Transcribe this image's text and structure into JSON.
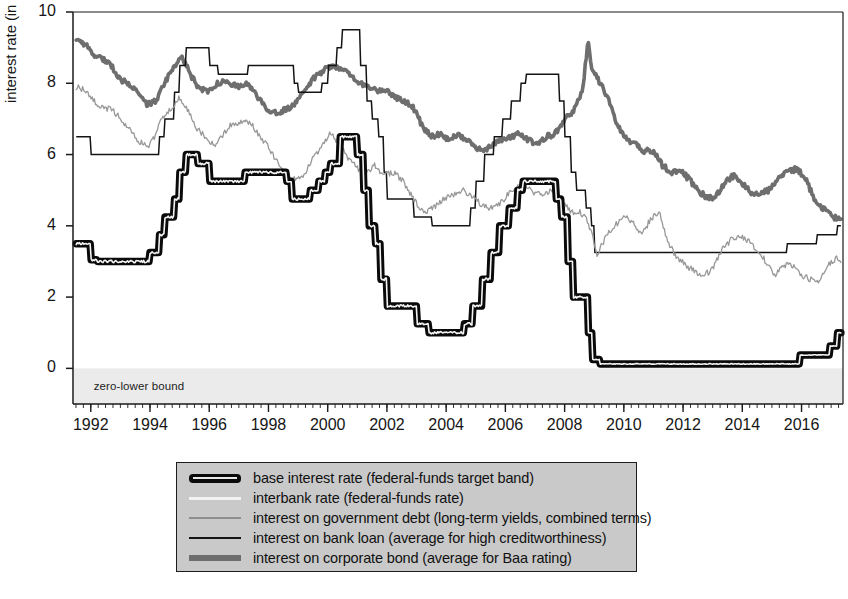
{
  "figure": {
    "background": "#ffffff",
    "plot_area": {
      "left": 73,
      "top": 12,
      "right": 843,
      "bottom": 404
    },
    "zlb_note": "zero-lower bound",
    "zlb_band_color": "#ebebeb"
  },
  "chart_data": {
    "type": "line",
    "title": "",
    "xlabel": "",
    "ylabel": "interest rate (in per cent)",
    "xlim": [
      1991.4,
      2017.4
    ],
    "ylim": [
      -1.0,
      10.0
    ],
    "ytick_values": [
      0,
      2,
      4,
      6,
      8,
      10
    ],
    "ytick_labels": [
      "0",
      "2",
      "4",
      "6",
      "8",
      "10"
    ],
    "xtick_values": [
      1992,
      1994,
      1996,
      1998,
      2000,
      2002,
      2004,
      2006,
      2008,
      2010,
      2012,
      2014,
      2016
    ],
    "xtick_labels": [
      "1992",
      "1994",
      "1996",
      "1998",
      "2000",
      "2002",
      "2004",
      "2006",
      "2008",
      "2010",
      "2012",
      "2014",
      "2016"
    ],
    "minor_xtick_step": 0.25,
    "grid": false,
    "legend_position": "below-center",
    "annotations": [
      {
        "text": "zero-lower bound",
        "x": 1992.1,
        "y": -0.55
      }
    ],
    "series": [
      {
        "name": "base interest rate (federal-funds target band)",
        "legend": "base interest rate (federal-funds target band)",
        "color": "#0a0a0a",
        "style": "band",
        "width": 7.5,
        "x": [
          1991.5,
          1991.9,
          1992.0,
          1992.2,
          1992.5,
          1993.0,
          1993.5,
          1993.9,
          1994.0,
          1994.3,
          1994.5,
          1994.8,
          1995.0,
          1995.2,
          1995.4,
          1995.6,
          1996.0,
          1996.3,
          1996.8,
          1997.2,
          1997.5,
          1998.0,
          1998.6,
          1998.8,
          1999.0,
          1999.4,
          1999.7,
          1999.9,
          2000.1,
          2000.4,
          2000.9,
          2001.0,
          2001.2,
          2001.4,
          2001.6,
          2001.8,
          2002.0,
          2002.5,
          2003.0,
          2003.4,
          2003.8,
          2004.3,
          2004.6,
          2004.9,
          2005.2,
          2005.5,
          2005.8,
          2006.1,
          2006.4,
          2006.6,
          2007.0,
          2007.5,
          2007.7,
          2007.9,
          2008.1,
          2008.3,
          2008.6,
          2008.8,
          2008.95,
          2009.2,
          2010.0,
          2011.0,
          2012.0,
          2013.0,
          2014.0,
          2015.0,
          2015.5,
          2015.95,
          2016.2,
          2016.6,
          2016.95,
          2017.2,
          2017.35
        ],
        "y": [
          3.5,
          3.5,
          3.05,
          3.0,
          3.0,
          3.0,
          3.0,
          3.0,
          3.25,
          3.75,
          4.25,
          4.75,
          5.5,
          6.0,
          6.0,
          5.75,
          5.25,
          5.25,
          5.25,
          5.5,
          5.5,
          5.5,
          5.25,
          4.75,
          4.75,
          5.0,
          5.25,
          5.5,
          5.75,
          6.5,
          6.5,
          6.0,
          5.0,
          4.0,
          3.5,
          2.5,
          1.75,
          1.75,
          1.25,
          1.0,
          1.0,
          1.0,
          1.25,
          1.75,
          2.5,
          3.25,
          4.0,
          4.5,
          5.0,
          5.25,
          5.25,
          5.25,
          4.75,
          4.25,
          3.0,
          2.0,
          2.0,
          1.0,
          0.25,
          0.125,
          0.125,
          0.125,
          0.125,
          0.125,
          0.125,
          0.125,
          0.125,
          0.375,
          0.375,
          0.375,
          0.625,
          1.0,
          1.2
        ]
      },
      {
        "name": "interbank rate (federal-funds rate)",
        "legend": "interbank rate (federal-funds rate)",
        "color": "#f4f4f4",
        "style": "thin-light",
        "width": 1.6,
        "note": "effective fed funds rate tracking the target band very closely"
      },
      {
        "name": "interest on government debt (long-term yields, combined terms)",
        "legend": "interest on government debt (long-term yields, combined terms)",
        "color": "#989898",
        "style": "thin",
        "width": 1.3,
        "x": [
          1991.5,
          1991.8,
          1992.1,
          1992.4,
          1992.7,
          1993.0,
          1993.3,
          1993.6,
          1993.9,
          1994.1,
          1994.4,
          1994.7,
          1995.0,
          1995.3,
          1995.6,
          1995.9,
          1996.2,
          1996.5,
          1996.8,
          1997.1,
          1997.4,
          1997.7,
          1998.0,
          1998.3,
          1998.6,
          1998.9,
          1999.2,
          1999.5,
          1999.8,
          2000.1,
          2000.4,
          2000.7,
          2001.0,
          2001.3,
          2001.6,
          2001.9,
          2002.2,
          2002.5,
          2002.8,
          2003.1,
          2003.4,
          2003.7,
          2004.0,
          2004.3,
          2004.6,
          2004.9,
          2005.2,
          2005.5,
          2005.8,
          2006.1,
          2006.4,
          2006.7,
          2007.0,
          2007.3,
          2007.6,
          2007.9,
          2008.2,
          2008.5,
          2008.8,
          2009.1,
          2009.4,
          2009.7,
          2010.0,
          2010.3,
          2010.6,
          2010.9,
          2011.2,
          2011.5,
          2011.8,
          2012.1,
          2012.4,
          2012.7,
          2013.0,
          2013.3,
          2013.6,
          2013.9,
          2014.2,
          2014.5,
          2014.8,
          2015.1,
          2015.4,
          2015.7,
          2016.0,
          2016.3,
          2016.6,
          2016.9,
          2017.2,
          2017.35
        ],
        "y": [
          7.9,
          7.8,
          7.5,
          7.3,
          7.3,
          7.0,
          6.7,
          6.4,
          6.2,
          6.4,
          7.0,
          7.3,
          7.6,
          7.2,
          6.7,
          6.5,
          6.2,
          6.6,
          6.9,
          6.9,
          6.9,
          6.5,
          6.2,
          5.8,
          5.5,
          5.3,
          5.4,
          5.9,
          6.2,
          6.6,
          6.3,
          5.9,
          5.6,
          5.5,
          5.7,
          5.4,
          5.5,
          5.3,
          4.9,
          4.5,
          4.4,
          4.6,
          4.8,
          4.9,
          5.0,
          4.8,
          4.6,
          4.5,
          4.6,
          4.9,
          5.1,
          5.1,
          4.9,
          4.9,
          5.0,
          4.7,
          4.4,
          4.4,
          4.1,
          3.2,
          3.7,
          4.0,
          4.3,
          4.1,
          3.7,
          4.2,
          4.4,
          3.5,
          3.1,
          2.9,
          2.7,
          2.6,
          2.8,
          3.3,
          3.6,
          3.7,
          3.6,
          3.3,
          3.0,
          2.6,
          2.9,
          2.9,
          2.6,
          2.5,
          2.4,
          2.9,
          3.1,
          3.0
        ]
      },
      {
        "name": "interest on bank loan (average for high creditworthiness)",
        "legend": "interest on bank loan (average for high creditworthiness)",
        "color": "#141414",
        "style": "step",
        "width": 1.5,
        "x": [
          1991.5,
          1991.9,
          1992.0,
          1992.6,
          1993.0,
          1994.0,
          1994.3,
          1994.5,
          1994.8,
          1995.0,
          1995.2,
          1995.5,
          1996.0,
          1996.3,
          1997.0,
          1997.3,
          1998.0,
          1998.7,
          1998.85,
          1999.0,
          1999.6,
          1999.8,
          2000.0,
          2000.3,
          2000.5,
          2001.0,
          2001.1,
          2001.3,
          2001.5,
          2001.7,
          2001.9,
          2002.0,
          2002.9,
          2003.0,
          2003.5,
          2004.0,
          2004.5,
          2004.8,
          2005.0,
          2005.3,
          2005.6,
          2005.9,
          2006.2,
          2006.5,
          2006.7,
          2007.0,
          2007.6,
          2007.8,
          2008.0,
          2008.2,
          2008.4,
          2008.7,
          2008.9,
          2009.0,
          2015.4,
          2015.5,
          2015.95,
          2016.2,
          2016.5,
          2016.95,
          2017.2,
          2017.35
        ],
        "y": [
          6.5,
          6.5,
          6.0,
          6.0,
          6.0,
          6.0,
          6.5,
          7.0,
          7.75,
          8.5,
          9.0,
          9.0,
          8.5,
          8.25,
          8.25,
          8.5,
          8.5,
          8.5,
          8.0,
          7.75,
          7.75,
          8.0,
          8.5,
          9.0,
          9.5,
          9.5,
          8.5,
          7.5,
          7.0,
          6.5,
          5.5,
          4.75,
          4.25,
          4.25,
          4.0,
          4.0,
          4.0,
          4.5,
          5.25,
          6.0,
          6.5,
          7.0,
          7.5,
          8.0,
          8.25,
          8.25,
          8.25,
          7.5,
          6.5,
          5.5,
          5.0,
          4.5,
          4.0,
          3.25,
          3.25,
          3.5,
          3.5,
          3.5,
          3.75,
          3.75,
          4.0,
          4.15
        ]
      },
      {
        "name": "interest on corporate bond (average for Baa rating)",
        "legend": "interest on corporate bond (average for Baa rating)",
        "color": "#6e6e6e",
        "style": "thick",
        "width": 3.6,
        "x": [
          1991.5,
          1991.8,
          1992.1,
          1992.4,
          1992.7,
          1993.0,
          1993.3,
          1993.6,
          1993.9,
          1994.2,
          1994.5,
          1994.8,
          1995.1,
          1995.4,
          1995.7,
          1996.0,
          1996.3,
          1996.6,
          1996.9,
          1997.2,
          1997.5,
          1997.8,
          1998.1,
          1998.4,
          1998.7,
          1999.0,
          1999.3,
          1999.6,
          1999.9,
          2000.2,
          2000.5,
          2000.8,
          2001.1,
          2001.4,
          2001.7,
          2002.0,
          2002.3,
          2002.6,
          2002.9,
          2003.2,
          2003.5,
          2003.8,
          2004.1,
          2004.4,
          2004.7,
          2005.0,
          2005.3,
          2005.6,
          2005.9,
          2006.2,
          2006.5,
          2006.8,
          2007.1,
          2007.4,
          2007.7,
          2008.0,
          2008.3,
          2008.6,
          2008.8,
          2008.9,
          2009.0,
          2009.2,
          2009.5,
          2009.8,
          2010.1,
          2010.4,
          2010.7,
          2011.0,
          2011.3,
          2011.6,
          2011.9,
          2012.2,
          2012.5,
          2012.8,
          2013.1,
          2013.4,
          2013.7,
          2014.0,
          2014.3,
          2014.6,
          2014.9,
          2015.2,
          2015.5,
          2015.8,
          2016.1,
          2016.4,
          2016.7,
          2017.0,
          2017.2,
          2017.35
        ],
        "y": [
          9.2,
          9.1,
          8.8,
          8.7,
          8.5,
          8.1,
          8.0,
          7.7,
          7.4,
          7.5,
          8.0,
          8.5,
          8.7,
          8.2,
          7.8,
          7.8,
          8.0,
          8.1,
          7.9,
          8.0,
          7.8,
          7.4,
          7.2,
          7.2,
          7.3,
          7.5,
          7.9,
          8.2,
          8.4,
          8.5,
          8.4,
          8.2,
          8.0,
          7.9,
          7.8,
          7.8,
          7.6,
          7.5,
          7.3,
          6.8,
          6.5,
          6.6,
          6.4,
          6.6,
          6.4,
          6.2,
          6.1,
          6.3,
          6.4,
          6.5,
          6.6,
          6.4,
          6.3,
          6.5,
          6.6,
          7.0,
          7.2,
          7.8,
          9.2,
          8.5,
          8.3,
          8.0,
          7.5,
          6.8,
          6.4,
          6.3,
          6.1,
          6.1,
          5.7,
          5.5,
          5.6,
          5.3,
          5.0,
          4.8,
          4.8,
          5.2,
          5.4,
          5.2,
          4.9,
          4.9,
          5.0,
          5.3,
          5.5,
          5.6,
          5.4,
          4.8,
          4.5,
          4.3,
          4.2,
          4.2
        ]
      }
    ]
  },
  "legend": {
    "items": [
      {
        "label": "base interest rate (federal-funds target band)",
        "swatch": "sw-base"
      },
      {
        "label": "interbank rate (federal-funds rate)",
        "swatch": "sw-interbank"
      },
      {
        "label": "interest on government debt (long-term yields, combined terms)",
        "swatch": "sw-govt"
      },
      {
        "label": "interest on bank loan (average for high creditworthiness)",
        "swatch": "sw-loan"
      },
      {
        "label": "interest on corporate bond (average for Baa rating)",
        "swatch": "sw-corp"
      }
    ]
  }
}
